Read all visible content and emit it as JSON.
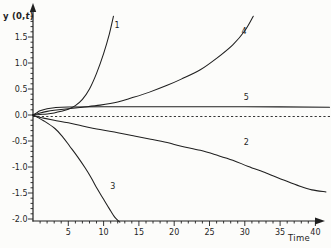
{
  "figure": {
    "background": "#fcfcfa",
    "line_color": "#1f1f1f",
    "y_axis_title_parts": {
      "prefix": "y",
      "mid": " (0,",
      "var": "t",
      "suffix": ")"
    }
  },
  "chart_data": {
    "type": "line",
    "title": "",
    "xlabel": "Time",
    "ylabel": "y (0,t)",
    "xlim": [
      0,
      42
    ],
    "ylim": [
      -2.05,
      1.95
    ],
    "grid": "off",
    "legend": "inline curve numbers",
    "x_ticks_major": [
      5,
      10,
      15,
      20,
      25,
      30,
      35,
      40
    ],
    "x_minor_step": 1,
    "y_ticks_major": [
      1.5,
      1.0,
      0.5,
      0.0,
      -0.5,
      -1.0,
      -1.5,
      -2.0
    ],
    "y_tick_labels": [
      "1.5",
      "1.0",
      "0.5",
      "0.0",
      "-0.5",
      "-1.0",
      "-1.5",
      "-2.0"
    ],
    "y_minor_step": 0.1,
    "zero_line": {
      "style": "dashed",
      "y": 0
    },
    "series": [
      {
        "name": "1",
        "label": "1",
        "label_pos": {
          "t": 11.9,
          "y": 1.67
        },
        "points": [
          [
            0,
            0
          ],
          [
            1,
            0.01
          ],
          [
            2,
            0.02
          ],
          [
            3,
            0.04
          ],
          [
            4,
            0.07
          ],
          [
            5,
            0.11
          ],
          [
            6,
            0.18
          ],
          [
            7,
            0.3
          ],
          [
            8,
            0.5
          ],
          [
            9,
            0.8
          ],
          [
            10,
            1.18
          ],
          [
            10.8,
            1.55
          ],
          [
            11.4,
            1.9
          ]
        ]
      },
      {
        "name": "4",
        "label": "4",
        "label_pos": {
          "t": 29.9,
          "y": 1.55
        },
        "points": [
          [
            0,
            0
          ],
          [
            1,
            0.04
          ],
          [
            2,
            0.07
          ],
          [
            3,
            0.09
          ],
          [
            5,
            0.12
          ],
          [
            7,
            0.15
          ],
          [
            9.5,
            0.19
          ],
          [
            12,
            0.25
          ],
          [
            14,
            0.33
          ],
          [
            16.5,
            0.44
          ],
          [
            19,
            0.57
          ],
          [
            21,
            0.69
          ],
          [
            23.7,
            0.87
          ],
          [
            26,
            1.09
          ],
          [
            28.3,
            1.35
          ],
          [
            30,
            1.62
          ],
          [
            31.2,
            1.9
          ]
        ]
      },
      {
        "name": "5",
        "label": "5",
        "label_pos": {
          "t": 30.2,
          "y": 0.28
        },
        "points": [
          [
            0,
            0
          ],
          [
            0.5,
            0.04
          ],
          [
            1,
            0.08
          ],
          [
            2,
            0.12
          ],
          [
            3,
            0.14
          ],
          [
            5,
            0.155
          ],
          [
            10,
            0.16
          ],
          [
            20,
            0.16
          ],
          [
            30,
            0.16
          ],
          [
            42,
            0.15
          ]
        ]
      },
      {
        "name": "2",
        "label": "2",
        "label_pos": {
          "t": 30.2,
          "y": -0.57
        },
        "points": [
          [
            0,
            0
          ],
          [
            0.5,
            -0.03
          ],
          [
            1.5,
            -0.06
          ],
          [
            3,
            -0.1
          ],
          [
            5,
            -0.15
          ],
          [
            7,
            -0.21
          ],
          [
            9.5,
            -0.28
          ],
          [
            12,
            -0.34
          ],
          [
            14.2,
            -0.4
          ],
          [
            16.5,
            -0.46
          ],
          [
            19,
            -0.53
          ],
          [
            21,
            -0.6
          ],
          [
            23.7,
            -0.68
          ],
          [
            26,
            -0.77
          ],
          [
            28.3,
            -0.87
          ],
          [
            30.5,
            -0.99
          ],
          [
            33.1,
            -1.12
          ],
          [
            35.5,
            -1.25
          ],
          [
            37.8,
            -1.37
          ],
          [
            39.5,
            -1.44
          ],
          [
            41.5,
            -1.48
          ]
        ]
      },
      {
        "name": "3",
        "label": "3",
        "label_pos": {
          "t": 11.3,
          "y": -1.42
        },
        "points": [
          [
            0,
            0
          ],
          [
            0.7,
            -0.05
          ],
          [
            1.5,
            -0.11
          ],
          [
            3.1,
            -0.26
          ],
          [
            4.2,
            -0.42
          ],
          [
            5.2,
            -0.6
          ],
          [
            6.3,
            -0.8
          ],
          [
            7.4,
            -1.02
          ],
          [
            8.3,
            -1.22
          ],
          [
            9.1,
            -1.42
          ],
          [
            10,
            -1.62
          ],
          [
            10.8,
            -1.8
          ],
          [
            11.6,
            -1.97
          ],
          [
            12.3,
            -2.06
          ]
        ]
      }
    ]
  }
}
